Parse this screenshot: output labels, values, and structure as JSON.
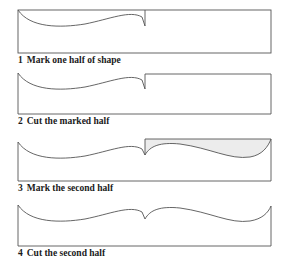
{
  "colors": {
    "line": "#555555",
    "shade": "#ececec",
    "text": "#1a1a1a",
    "background": "#ffffff"
  },
  "steps": [
    {
      "number": "1",
      "label": "Mark one half of shape"
    },
    {
      "number": "2",
      "label": "Cut the marked half"
    },
    {
      "number": "3",
      "label": "Mark the second half"
    },
    {
      "number": "4",
      "label": "Cut the second half"
    }
  ]
}
